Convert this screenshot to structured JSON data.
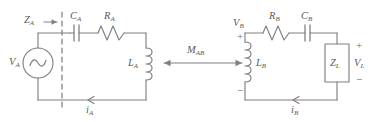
{
  "figure": {
    "type": "circuit-schematic",
    "stroke_color": "#808080",
    "label_color": "#5a5a5a",
    "background": "#ffffff"
  },
  "labels": {
    "z_a": "Z",
    "z_a_sub": "A",
    "v_a": "V",
    "v_a_sub": "A",
    "c_a": "C",
    "c_a_sub": "A",
    "r_a": "R",
    "r_a_sub": "A",
    "l_a": "L",
    "l_a_sub": "A",
    "i_a": "i",
    "i_a_sub": "A",
    "m_ab": "M",
    "m_ab_sub": "AB",
    "v_b": "V",
    "v_b_sub": "B",
    "r_b": "R",
    "r_b_sub": "B",
    "c_b": "C",
    "c_b_sub": "B",
    "l_b": "L",
    "l_b_sub": "B",
    "i_b": "i",
    "i_b_sub": "B",
    "z_l": "Z",
    "z_l_sub": "L",
    "v_l": "V",
    "v_l_sub": "L",
    "plus_vb": "+",
    "minus_vb": "−",
    "plus_vl": "+",
    "minus_vl": "−"
  },
  "components": {
    "source": {
      "name": "ac-voltage-source",
      "symbol": "sine-wave-circle"
    },
    "capacitor_a": {
      "name": "capacitor-c-a",
      "symbol": "parallel-plates"
    },
    "resistor_a": {
      "name": "resistor-r-a",
      "symbol": "zigzag"
    },
    "inductor_a": {
      "name": "inductor-l-a",
      "symbol": "coil"
    },
    "resistor_b": {
      "name": "resistor-r-b",
      "symbol": "zigzag"
    },
    "capacitor_b": {
      "name": "capacitor-c-b",
      "symbol": "parallel-plates"
    },
    "inductor_b": {
      "name": "inductor-l-b",
      "symbol": "coil"
    },
    "load_impedance": {
      "name": "load-z-l",
      "symbol": "rectangle-box"
    },
    "coupling": {
      "name": "mutual-inductance-arrow",
      "symbol": "double-headed-arrow"
    },
    "reference_line": {
      "name": "impedance-reference-dashed-line",
      "symbol": "vertical-dashed"
    }
  }
}
